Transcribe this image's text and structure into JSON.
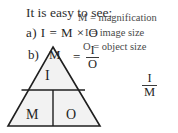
{
  "page": {
    "headline": "It is easy to see:",
    "background_color": "#ffffff",
    "ink_color": "#2b2b2b",
    "width": 178,
    "height": 133
  },
  "legend": {
    "magnification": "M = magnification",
    "image_size": "I = image size",
    "object_size": "O = object size"
  },
  "equations": {
    "a_label": "a)",
    "a_text": "a)  I  =  M × O",
    "b_label": "b)",
    "b_symbol": "M",
    "b_equals": "=",
    "b_fraction": {
      "numerator": "I",
      "denominator": "O"
    },
    "extra_fraction": {
      "numerator": "I",
      "denominator": "M"
    }
  },
  "triangle": {
    "top_cell": "I",
    "bottom_left_cell": "M",
    "bottom_right_cell": "O",
    "fill_color": "#f2f2f2",
    "stroke_color": "#1f1f1f"
  }
}
